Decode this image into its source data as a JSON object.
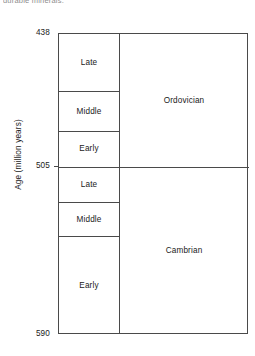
{
  "caption_fragment": "durable minerals.",
  "chart_data": {
    "type": "table",
    "title": "",
    "ylabel": "Age  (million years)",
    "xlabel": "",
    "ylim": [
      438,
      590
    ],
    "y_inverted": true,
    "grid": false,
    "legend": "none",
    "axis_ticks": [
      {
        "value": "438",
        "age": 438
      },
      {
        "value": "505",
        "age": 505
      },
      {
        "value": "590",
        "age": 590
      }
    ],
    "columns": [
      "Epoch",
      "Period"
    ],
    "periods": [
      {
        "name": "Ordovician",
        "top_age": 438,
        "base_age": 505,
        "epochs": [
          {
            "name": "Late",
            "top_age": 438,
            "base_age": 467
          },
          {
            "name": "Middle",
            "top_age": 467,
            "base_age": 487
          },
          {
            "name": "Early",
            "top_age": 487,
            "base_age": 505
          }
        ]
      },
      {
        "name": "Cambrian",
        "top_age": 505,
        "base_age": 590,
        "epochs": [
          {
            "name": "Late",
            "top_age": 505,
            "base_age": 523
          },
          {
            "name": "Middle",
            "top_age": 523,
            "base_age": 540
          },
          {
            "name": "Early",
            "top_age": 540,
            "base_age": 590
          }
        ]
      }
    ],
    "colors": {
      "line": "#4a4a4a",
      "text": "#1a1a1a",
      "background": "#ffffff"
    }
  }
}
